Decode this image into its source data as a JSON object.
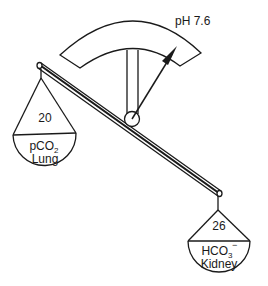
{
  "diagram": {
    "type": "acid-base balance scale",
    "gauge": {
      "label": "pH 7.6"
    },
    "left_pan": {
      "value": "20",
      "component": "pCO",
      "component_subscript": "2",
      "organ": "Lung"
    },
    "right_pan": {
      "value": "26",
      "component": "HCO",
      "component_subscript": "3",
      "component_superscript": "−",
      "organ": "Kidney"
    },
    "colors": {
      "stroke": "#1a1a1a",
      "background": "#ffffff"
    }
  }
}
